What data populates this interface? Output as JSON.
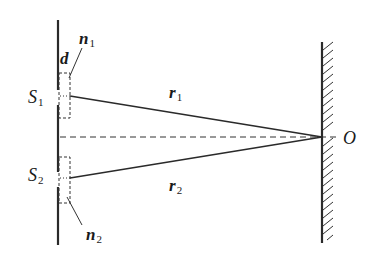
{
  "diagram": {
    "type": "double-slit interference with reflecting screen",
    "labels": {
      "slit1": {
        "main": "S",
        "sub": "1"
      },
      "slit2": {
        "main": "S",
        "sub": "2"
      },
      "path1": {
        "main": "r",
        "sub": "1"
      },
      "path2": {
        "main": "r",
        "sub": "2"
      },
      "medium1": {
        "main": "n",
        "sub": "1"
      },
      "medium2": {
        "main": "n",
        "sub": "2"
      },
      "thickness": "d",
      "point": "O"
    },
    "colors": {
      "line": "#2a2a2a",
      "background": "#ffffff"
    }
  }
}
